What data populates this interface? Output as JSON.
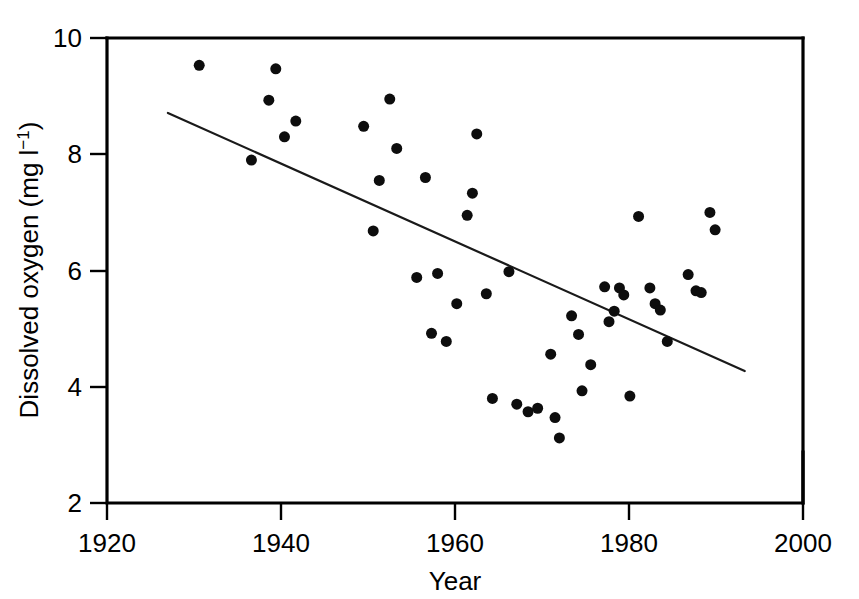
{
  "chart_data": {
    "type": "scatter",
    "title": "",
    "xlabel": "Year",
    "ylabel": "Dissolved oxygen (mg l⁻¹)",
    "ylabel_main": "Dissolved oxygen (mg l",
    "ylabel_exponent": "−1",
    "ylabel_tail": ")",
    "xlim": [
      1920,
      2000
    ],
    "ylim": [
      2,
      10
    ],
    "xticks": [
      1920,
      1940,
      1960,
      1980,
      2000
    ],
    "xtick_labels": [
      "1920",
      "1940",
      "1960",
      "1980",
      "2000"
    ],
    "yticks": [
      2,
      4,
      6,
      8,
      10
    ],
    "ytick_labels": [
      "2",
      "4",
      "6",
      "8",
      "10"
    ],
    "grid": false,
    "legend": false,
    "marker": "filled-circle",
    "marker_color": "#0d0d0d",
    "marker_size_px": 11,
    "points": [
      {
        "x": 1930.6,
        "y": 9.53
      },
      {
        "x": 1936.6,
        "y": 7.9
      },
      {
        "x": 1938.6,
        "y": 8.93
      },
      {
        "x": 1939.4,
        "y": 9.47
      },
      {
        "x": 1940.4,
        "y": 8.3
      },
      {
        "x": 1941.7,
        "y": 8.57
      },
      {
        "x": 1949.5,
        "y": 8.48
      },
      {
        "x": 1950.6,
        "y": 6.68
      },
      {
        "x": 1951.3,
        "y": 7.55
      },
      {
        "x": 1952.5,
        "y": 8.95
      },
      {
        "x": 1953.3,
        "y": 8.1
      },
      {
        "x": 1955.6,
        "y": 5.88
      },
      {
        "x": 1956.6,
        "y": 7.6
      },
      {
        "x": 1957.3,
        "y": 4.92
      },
      {
        "x": 1958.0,
        "y": 5.95
      },
      {
        "x": 1959.0,
        "y": 4.78
      },
      {
        "x": 1960.2,
        "y": 5.43
      },
      {
        "x": 1961.4,
        "y": 6.95
      },
      {
        "x": 1962.0,
        "y": 7.33
      },
      {
        "x": 1962.5,
        "y": 8.35
      },
      {
        "x": 1963.6,
        "y": 5.6
      },
      {
        "x": 1964.3,
        "y": 3.8
      },
      {
        "x": 1966.2,
        "y": 5.98
      },
      {
        "x": 1967.1,
        "y": 3.7
      },
      {
        "x": 1968.4,
        "y": 3.57
      },
      {
        "x": 1969.5,
        "y": 3.63
      },
      {
        "x": 1971.0,
        "y": 4.56
      },
      {
        "x": 1971.5,
        "y": 3.47
      },
      {
        "x": 1972.0,
        "y": 3.12
      },
      {
        "x": 1973.4,
        "y": 5.22
      },
      {
        "x": 1974.2,
        "y": 4.9
      },
      {
        "x": 1974.6,
        "y": 3.93
      },
      {
        "x": 1975.6,
        "y": 4.38
      },
      {
        "x": 1977.2,
        "y": 5.72
      },
      {
        "x": 1977.7,
        "y": 5.12
      },
      {
        "x": 1978.3,
        "y": 5.3
      },
      {
        "x": 1978.9,
        "y": 5.7
      },
      {
        "x": 1979.4,
        "y": 5.58
      },
      {
        "x": 1980.1,
        "y": 3.84
      },
      {
        "x": 1981.1,
        "y": 6.93
      },
      {
        "x": 1982.4,
        "y": 5.7
      },
      {
        "x": 1983.0,
        "y": 5.43
      },
      {
        "x": 1983.6,
        "y": 5.32
      },
      {
        "x": 1984.4,
        "y": 4.78
      },
      {
        "x": 1986.8,
        "y": 5.93
      },
      {
        "x": 1987.7,
        "y": 5.65
      },
      {
        "x": 1988.3,
        "y": 5.62
      },
      {
        "x": 1989.3,
        "y": 7.0
      },
      {
        "x": 1989.9,
        "y": 6.7
      }
    ],
    "trend_line": {
      "label": "linear regression",
      "x_start": 1927.0,
      "y_start": 8.71,
      "x_end": 1993.3,
      "y_end": 4.27
    }
  }
}
